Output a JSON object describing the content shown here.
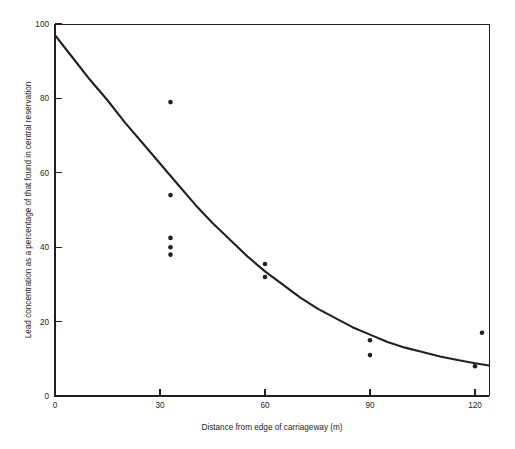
{
  "chart_data": {
    "type": "scatter",
    "title": "",
    "subtitle": "",
    "xlabel": "Distance from edge of carriageway (m)",
    "ylabel": "Lead concentration as a percentage of that found in central reservation",
    "xlim": [
      0,
      124
    ],
    "ylim": [
      0,
      100
    ],
    "xticks": [
      0,
      30,
      60,
      90,
      120
    ],
    "xtick_labels": [
      "0",
      "30",
      "60",
      "90",
      "120"
    ],
    "yticks": [
      0,
      20,
      40,
      60,
      80,
      100
    ],
    "ytick_labels": [
      "0",
      "20",
      "40",
      "60",
      "80",
      "100"
    ],
    "grid": false,
    "legend": null,
    "legend_position": "none",
    "point_color": "#231f20",
    "curve_color": "#231f20",
    "axis_color": "#231f20",
    "background_color": "#ffffff",
    "marker": "filled-circle",
    "marker_size_px": 4.6,
    "series": [
      {
        "name": "Measured lead concentration",
        "type": "scatter",
        "x": [
          33,
          33,
          33,
          33,
          33,
          60,
          60,
          90,
          90,
          120,
          122
        ],
        "y": [
          79,
          54,
          42.5,
          40,
          38,
          35.5,
          32,
          15,
          11,
          8,
          17
        ]
      },
      {
        "name": "Fitted exponential decay curve",
        "type": "line",
        "x": [
          0,
          5,
          10,
          15,
          20,
          25,
          30,
          35,
          40,
          45,
          50,
          55,
          60,
          65,
          70,
          75,
          80,
          85,
          90,
          95,
          100,
          105,
          110,
          115,
          120,
          124
        ],
        "y": [
          97,
          91,
          85,
          79.5,
          73.5,
          68,
          62.5,
          57,
          51.5,
          46.5,
          42,
          37.5,
          33.5,
          30,
          26.5,
          23.5,
          21,
          18.5,
          16.5,
          14.5,
          13,
          11.8,
          10.6,
          9.7,
          8.8,
          8.2
        ]
      }
    ],
    "annotations": []
  },
  "axes": {
    "x_axis_title": "Distance from edge of carriageway (m)",
    "y_axis_title": "Lead concentration as a percentage of that found in central reservation"
  }
}
